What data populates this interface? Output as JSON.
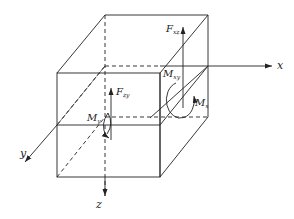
{
  "diagram": {
    "title": "",
    "axes": {
      "x": "x",
      "y": "y",
      "z": "z"
    },
    "labels": {
      "fxz": {
        "main": "F",
        "sub": "xz"
      },
      "mxy": {
        "main": "M",
        "sub": "xy"
      },
      "mx": {
        "main": "M",
        "sub": "x"
      },
      "fzy": {
        "main": "F",
        "sub": "zy"
      },
      "my": {
        "main": "M",
        "sub": "y"
      }
    },
    "colors": {
      "line": "#222222",
      "background": "#ffffff"
    }
  }
}
